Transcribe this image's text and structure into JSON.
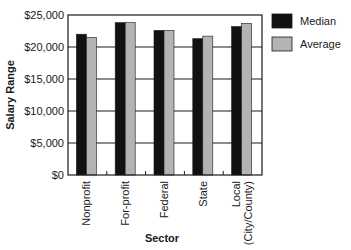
{
  "chart_data": {
    "type": "bar",
    "title": "",
    "xlabel": "Sector",
    "ylabel": "Salary Range",
    "categories": [
      "Nonprofit",
      "For-profit",
      "Federal",
      "State",
      "Local (City/County)"
    ],
    "category_lines": [
      [
        "Nonprofit"
      ],
      [
        "For-profit"
      ],
      [
        "Federal"
      ],
      [
        "State"
      ],
      [
        "Local",
        "(City/County)"
      ]
    ],
    "series": [
      {
        "name": "Median",
        "color": "#111111",
        "values": [
          22000,
          23800,
          22600,
          21300,
          23200
        ]
      },
      {
        "name": "Average",
        "color": "#b3b3b3",
        "values": [
          21500,
          23800,
          22600,
          21700,
          23700
        ]
      }
    ],
    "ylim": [
      0,
      25000
    ],
    "yticks": [
      0,
      5000,
      10000,
      15000,
      20000,
      25000
    ],
    "ytick_labels": [
      "$0",
      "$5,000",
      "$10,000",
      "$15,000",
      "$20,000",
      "$25,000"
    ],
    "grid": true,
    "legend_position": "right-top"
  }
}
